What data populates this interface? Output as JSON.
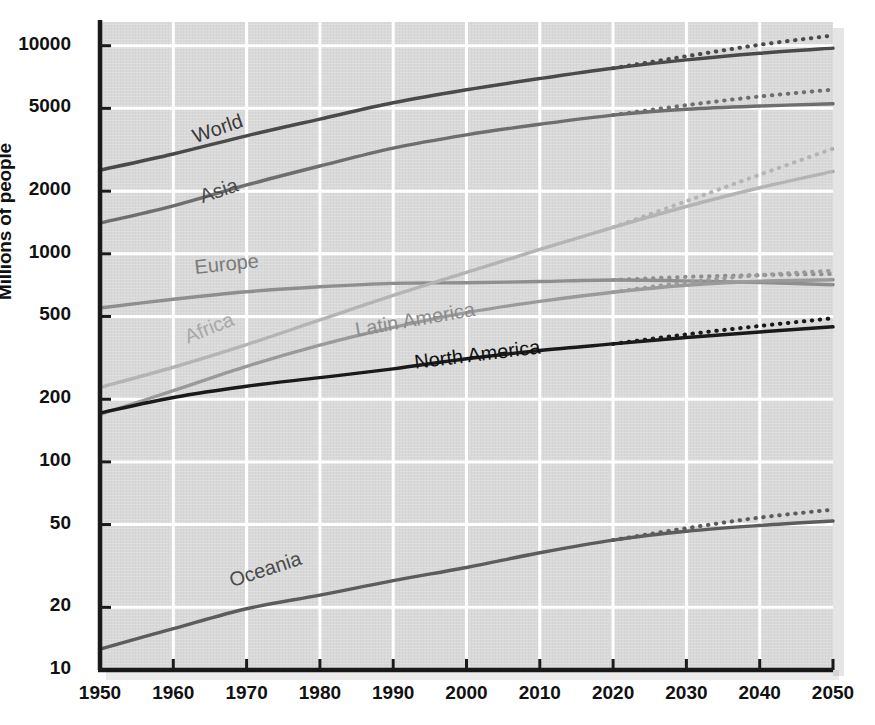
{
  "chart_data": {
    "type": "line",
    "title": "",
    "xlabel": "",
    "ylabel": "Millions of people",
    "yscale": "log",
    "ylim": [
      10,
      13000
    ],
    "xlim": [
      1950,
      2050
    ],
    "grid": true,
    "legend": "inline-labels",
    "x_ticks": [
      1950,
      1960,
      1970,
      1980,
      1990,
      2000,
      2010,
      2020,
      2030,
      2040,
      2050
    ],
    "y_ticks": [
      10,
      20,
      50,
      100,
      200,
      500,
      1000,
      2000,
      5000,
      10000
    ],
    "x": [
      1950,
      1960,
      1970,
      1980,
      1990,
      2000,
      2010,
      2020,
      2030,
      2040,
      2050
    ],
    "projection_start_year": 2020,
    "series": [
      {
        "name": "World",
        "color": "#4a4a4a",
        "label_color": "#3a3a3a",
        "label_x": 1963,
        "label_y": 3400,
        "label_rotation": -19,
        "values": [
          2525,
          3018,
          3691,
          4440,
          5320,
          6144,
          6957,
          7795,
          8548,
          9199,
          9735
        ],
        "projection_high": [
          null,
          null,
          null,
          null,
          null,
          null,
          null,
          7795,
          8900,
          10100,
          11200
        ]
      },
      {
        "name": "Asia",
        "color": "#6e6e6e",
        "label_color": "#4a4a4a",
        "label_x": 1964,
        "label_y": 1750,
        "label_rotation": -19,
        "values": [
          1404,
          1700,
          2142,
          2642,
          3221,
          3730,
          4194,
          4641,
          4947,
          5130,
          5257
        ],
        "projection_high": [
          null,
          null,
          null,
          null,
          null,
          null,
          null,
          4641,
          5180,
          5700,
          6150
        ]
      },
      {
        "name": "Europe",
        "color": "#8e8e8e",
        "label_color": "#7a7a7a",
        "label_x": 1963,
        "label_y": 800,
        "label_rotation": -6,
        "values": [
          549,
          605,
          657,
          694,
          721,
          726,
          736,
          748,
          741,
          728,
          710
        ],
        "projection_high": [
          null,
          null,
          null,
          null,
          null,
          null,
          null,
          748,
          775,
          790,
          800
        ]
      },
      {
        "name": "Africa",
        "color": "#b4b4b4",
        "label_color": "#a8a8a8",
        "label_x": 1962,
        "label_y": 370,
        "label_rotation": -22,
        "values": [
          228,
          285,
          366,
          481,
          631,
          814,
          1049,
          1341,
          1688,
          2077,
          2489
        ],
        "projection_high": [
          null,
          null,
          null,
          null,
          null,
          null,
          null,
          1341,
          1790,
          2400,
          3200
        ]
      },
      {
        "name": "Latin America",
        "color": "#9a9a9a",
        "label_color": "#8c8c8c",
        "label_x": 1985,
        "label_y": 400,
        "label_rotation": -10,
        "values": [
          169,
          220,
          288,
          364,
          443,
          522,
          591,
          654,
          706,
          738,
          750
        ],
        "projection_high": [
          null,
          null,
          null,
          null,
          null,
          null,
          null,
          654,
          730,
          790,
          830
        ]
      },
      {
        "name": "North America",
        "color": "#1a1a1a",
        "label_color": "#111111",
        "label_x": 1993,
        "label_y": 280,
        "label_rotation": -7,
        "values": [
          172,
          204,
          231,
          254,
          280,
          313,
          343,
          369,
          396,
          421,
          446
        ],
        "projection_high": [
          null,
          null,
          null,
          null,
          null,
          null,
          null,
          369,
          410,
          450,
          490
        ]
      },
      {
        "name": "Oceania",
        "color": "#5c5c5c",
        "label_color": "#4a4a4a",
        "label_x": 1968,
        "label_y": 25,
        "label_rotation": -18,
        "values": [
          12.6,
          15.8,
          19.7,
          22.9,
          26.9,
          31.1,
          36.6,
          42.1,
          46.4,
          49.5,
          52.0
        ],
        "projection_high": [
          null,
          null,
          null,
          null,
          null,
          null,
          null,
          42.1,
          48.0,
          54.0,
          59.0
        ]
      }
    ]
  },
  "axis": {
    "y_title": "Millions of people",
    "y_tick_labels": [
      "10000",
      "5000",
      "2000",
      "1000",
      "500",
      "200",
      "100",
      "50",
      "20",
      "10"
    ],
    "x_tick_labels": [
      "1950",
      "1960",
      "1970",
      "1980",
      "1990",
      "2000",
      "2010",
      "2020",
      "2030",
      "2040",
      "2050"
    ]
  },
  "series_labels": {
    "world": "World",
    "asia": "Asia",
    "europe": "Europe",
    "africa": "Africa",
    "latin_america": "Latin America",
    "north_america": "North America",
    "oceania": "Oceania"
  },
  "colors": {
    "plot_background": "#d9d9d9",
    "grid": "#ffffff",
    "axis": "#1a1a1a",
    "page_background": "#ffffff"
  }
}
